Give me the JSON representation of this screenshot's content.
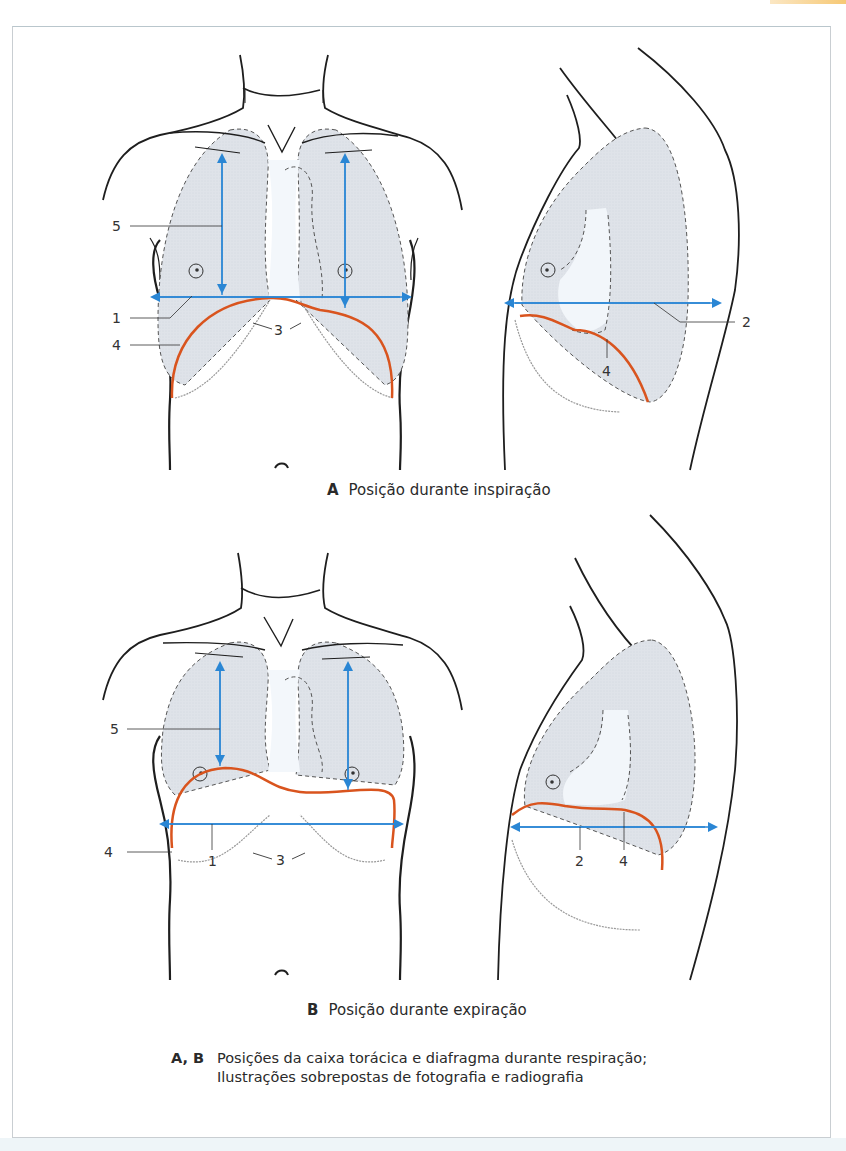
{
  "figure": {
    "panel_a": {
      "letter": "A",
      "caption": "Posição durante inspiração",
      "labels": {
        "l1": "1",
        "l2": "2",
        "l3": "3",
        "l4": "4",
        "l4b": "4",
        "l5": "5"
      }
    },
    "panel_b": {
      "letter": "B",
      "caption": "Posição durante expiração",
      "labels": {
        "l1": "1",
        "l2": "2",
        "l3": "3",
        "l4": "4",
        "l4b": "4",
        "l5": "5"
      }
    },
    "legend": {
      "letters": "A, B",
      "line1": "Posições da caixa torácica e diafragma durante respiração;",
      "line2": "Ilustrações sobrepostas de fotografia e radiografia"
    }
  },
  "colors": {
    "diaphragm": "#d9541e",
    "arrow": "#2a86d4",
    "lung_fill": "#dfe4ea",
    "outline": "#1e1e1e"
  }
}
